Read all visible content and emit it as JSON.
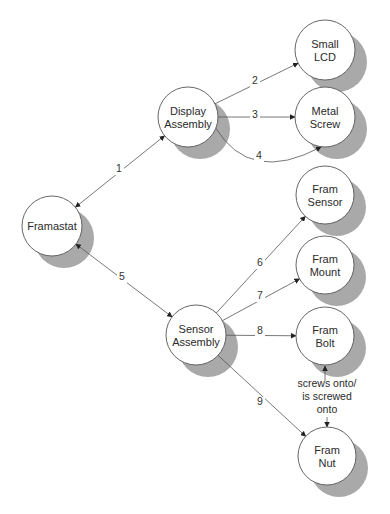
{
  "diagram": {
    "nodes": [
      {
        "id": "framastat",
        "lines": [
          "Framastat"
        ]
      },
      {
        "id": "display",
        "lines": [
          "Display",
          "Assembly"
        ]
      },
      {
        "id": "sensorasm",
        "lines": [
          "Sensor",
          "Assembly"
        ]
      },
      {
        "id": "lcd",
        "lines": [
          "Small",
          "LCD"
        ]
      },
      {
        "id": "screw",
        "lines": [
          "Metal",
          "Screw"
        ]
      },
      {
        "id": "fsensor",
        "lines": [
          "Fram",
          "Sensor"
        ]
      },
      {
        "id": "fmount",
        "lines": [
          "Fram",
          "Mount"
        ]
      },
      {
        "id": "fbolt",
        "lines": [
          "Fram",
          "Bolt"
        ]
      },
      {
        "id": "fnut",
        "lines": [
          "Fram",
          "Nut"
        ]
      }
    ],
    "edges": [
      {
        "label": "1",
        "from": "display",
        "to": "framastat",
        "bidirectional": true
      },
      {
        "label": "2",
        "from": "display",
        "to": "lcd"
      },
      {
        "label": "3",
        "from": "display",
        "to": "screw"
      },
      {
        "label": "4",
        "from": "display",
        "to": "screw",
        "curved": true
      },
      {
        "label": "5",
        "from": "framastat",
        "to": "sensorasm",
        "bidirectional": true
      },
      {
        "label": "6",
        "from": "sensorasm",
        "to": "fsensor"
      },
      {
        "label": "7",
        "from": "sensorasm",
        "to": "fmount"
      },
      {
        "label": "8",
        "from": "sensorasm",
        "to": "fbolt"
      },
      {
        "label": "9",
        "from": "sensorasm",
        "to": "fnut"
      }
    ],
    "relationship_note": [
      "screws onto/",
      "is screwed",
      "onto"
    ],
    "colors": {
      "shadow": "#a9a9a9",
      "stroke": "#555555",
      "fill": "#ffffff"
    }
  }
}
